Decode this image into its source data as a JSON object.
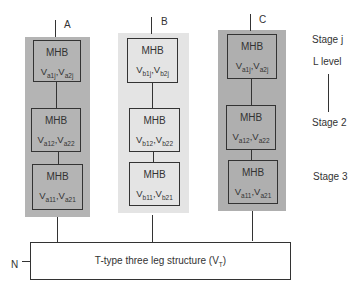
{
  "columns": [
    {
      "label": "A",
      "bg": "#b4b4b4",
      "blocks": [
        {
          "title": "MHB",
          "v1": "V",
          "s1": "a1j",
          "v2": "V",
          "s2": "a2j"
        },
        {
          "title": "MHB",
          "v1": "V",
          "s1": "a12",
          "v2": "V",
          "s2": "a22"
        },
        {
          "title": "MHB",
          "v1": "V",
          "s1": "a11",
          "v2": "V",
          "s2": "a21"
        }
      ]
    },
    {
      "label": "B",
      "bg": "#e4e4e4",
      "blocks": [
        {
          "title": "MHB",
          "v1": "V",
          "s1": "b1j",
          "v2": "V",
          "s2": "b2j"
        },
        {
          "title": "MHB",
          "v1": "V",
          "s1": "b12",
          "v2": "V",
          "s2": "b22"
        },
        {
          "title": "MHB",
          "v1": "V",
          "s1": "b11",
          "v2": "V",
          "s2": "b21"
        }
      ]
    },
    {
      "label": "C",
      "bg": "#afafaf",
      "blocks": [
        {
          "title": "MHB",
          "v1": "V",
          "s1": "a1j",
          "v2": "V",
          "s2": "a2j"
        },
        {
          "title": "MHB",
          "v1": "V",
          "s1": "a12",
          "v2": "V",
          "s2": "a22"
        },
        {
          "title": "MHB",
          "v1": "V",
          "s1": "a11",
          "v2": "V",
          "s2": "a21"
        }
      ]
    }
  ],
  "stages": {
    "stage_j": "Stage j",
    "l_level": "L level",
    "stage_2": "Stage 2",
    "stage_3": "Stage 3"
  },
  "bottom": {
    "text": "T-type three leg structure (V",
    "sub": "T",
    "close": ")"
  },
  "neutral_label": "N"
}
